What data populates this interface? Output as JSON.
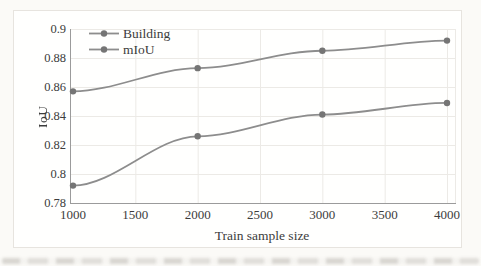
{
  "page": {
    "background": "#fbfaf7"
  },
  "figure": {
    "background": "#fffffe",
    "border_color": "#e7e4df"
  },
  "chart_data": {
    "type": "line",
    "title": "",
    "xlabel": "Train sample size",
    "ylabel": "IoU",
    "x": [
      1000,
      2000,
      3000,
      4000
    ],
    "series": [
      {
        "name": "Building",
        "values": [
          0.792,
          0.826,
          0.841,
          0.849
        ]
      },
      {
        "name": "mIoU",
        "values": [
          0.857,
          0.873,
          0.885,
          0.892
        ]
      }
    ],
    "xlim": [
      1000,
      4000
    ],
    "ylim": [
      0.78,
      0.9
    ],
    "xticks": [
      1000,
      1500,
      2000,
      2500,
      3000,
      3500,
      4000
    ],
    "xtick_labels": [
      "1000",
      "1500",
      "2000",
      "2500",
      "3000",
      "3500",
      "4000"
    ],
    "yticks": [
      0.9,
      0.88,
      0.86,
      0.84,
      0.82,
      0.8,
      0.78
    ],
    "ytick_labels": [
      "0.9",
      "0.88",
      "0.86",
      "0.84",
      "0.82",
      "0.8",
      "0.78"
    ],
    "grid": true,
    "legend_position": "top-left-inside",
    "colors": {
      "line": "#8d8d8d",
      "marker": "#757575",
      "gridline": "#eceae6",
      "axis": "#9b9b9b",
      "text": "#3c3c3c"
    }
  }
}
